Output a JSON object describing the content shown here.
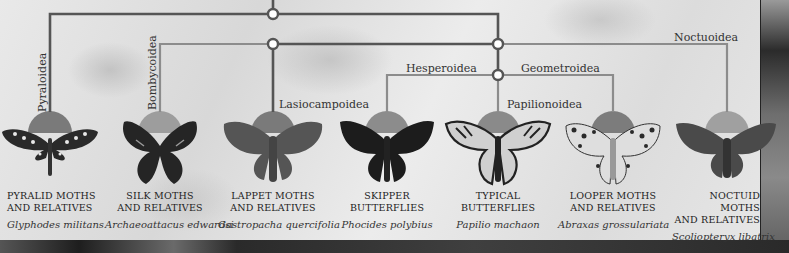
{
  "diagram": {
    "type": "phylogenetic-tree",
    "theme": "grayscale",
    "colors": {
      "panel_bg": "#e4e4e4",
      "main_branch": "#555555",
      "light_branch": "#8a8a8a",
      "node_fill": "#ffffff",
      "semicircle": "#7a7a7a",
      "semicircle_light": "#9a9a9a",
      "text": "#333333"
    },
    "clade_labels": {
      "pyraloidea": "Pyraloidea",
      "bombycoidea": "Bombycoidea",
      "lasiocampoidea": "Lasiocampoidea",
      "hesperoidea": "Hesperoidea",
      "geometroidea": "Geometroidea",
      "papilionoidea": "Papilionoidea",
      "noctuoidea": "Noctuoidea"
    },
    "groups": [
      {
        "id": "pyralid",
        "common_line1": "PYRALID MOTHS",
        "common_line2": "AND RELATIVES",
        "scientific": "Glyphodes militans",
        "clade": "Pyraloidea"
      },
      {
        "id": "silk",
        "common_line1": "SILK MOTHS",
        "common_line2": "AND RELATIVES",
        "scientific": "Archaeoattacus edwardsi",
        "clade": "Bombycoidea"
      },
      {
        "id": "lappet",
        "common_line1": "LAPPET MOTHS",
        "common_line2": "AND RELATIVES",
        "scientific": "Gastropacha quercifolia",
        "clade": "Lasiocampoidea"
      },
      {
        "id": "skipper",
        "common_line1": "SKIPPER",
        "common_line2": "BUTTERFLIES",
        "scientific": "Phocides polybius",
        "clade": "Hesperoidea"
      },
      {
        "id": "typical",
        "common_line1": "TYPICAL",
        "common_line2": "BUTTERFLIES",
        "scientific": "Papilio machaon",
        "clade": "Papilionoidea"
      },
      {
        "id": "looper",
        "common_line1": "LOOPER MOTHS",
        "common_line2": "AND RELATIVES",
        "scientific": "Abraxas grossulariata",
        "clade": "Geometroidea"
      },
      {
        "id": "noctuid",
        "common_line1": "NOCTUID MOTHS",
        "common_line2": "AND RELATIVES",
        "scientific": "Scoliopteryx libatrix",
        "clade": "Noctuoidea"
      }
    ]
  }
}
